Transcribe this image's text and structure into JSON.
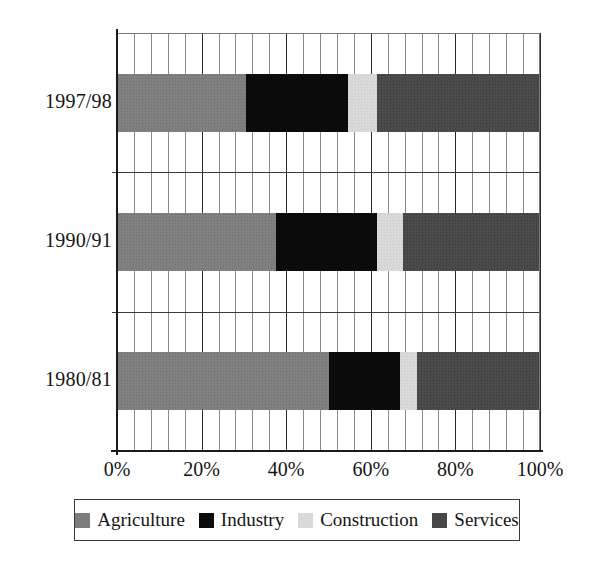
{
  "chart_data": {
    "type": "bar",
    "orientation": "horizontal",
    "stacked": true,
    "normalized": "100%",
    "title": "",
    "subtitle": "",
    "xlabel": "",
    "ylabel": "",
    "xlim": [
      0,
      100
    ],
    "xticks": [
      0,
      20,
      40,
      60,
      80,
      100
    ],
    "xtick_labels": [
      "0%",
      "20%",
      "40%",
      "60%",
      "80%",
      "100%"
    ],
    "minor_tick_step": 4,
    "grid": true,
    "grid_axis": "x",
    "legend_position": "bottom",
    "categories": [
      "1997/98",
      "1990/91",
      "1980/81"
    ],
    "series": [
      {
        "name": "Agriculture",
        "color": "#7d7d7d",
        "values": [
          30.5,
          37.5,
          50.0
        ]
      },
      {
        "name": "Industry",
        "color": "#0b0b0b",
        "values": [
          24.0,
          24.0,
          17.0
        ]
      },
      {
        "name": "Construction",
        "color": "#d9d9d9",
        "values": [
          7.0,
          6.0,
          4.0
        ]
      },
      {
        "name": "Services",
        "color": "#474747",
        "values": [
          38.5,
          32.5,
          29.0
        ]
      }
    ]
  },
  "legend": {
    "items": [
      {
        "label": "Agriculture",
        "swatch": "agriculture"
      },
      {
        "label": "Industry",
        "swatch": "industry"
      },
      {
        "label": "Construction",
        "swatch": "construction"
      },
      {
        "label": "Services",
        "swatch": "services"
      }
    ]
  }
}
